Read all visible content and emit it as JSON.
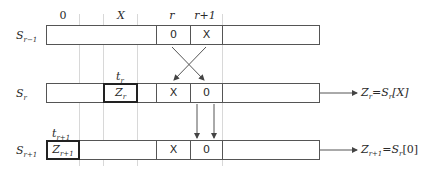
{
  "column_labels": {
    "zero": "0",
    "x": "X",
    "r": "r",
    "r_plus_1": "r+1"
  },
  "rows": [
    {
      "label": "S",
      "sub": "r−1",
      "cells": {
        "r": "0",
        "r_plus_1": "X"
      }
    },
    {
      "label": "S",
      "sub": "r",
      "highlight": {
        "label": "Z",
        "sub": "r",
        "above": "t",
        "above_sub": "r"
      },
      "cells": {
        "r": "X",
        "r_plus_1": "0"
      }
    },
    {
      "label": "S",
      "sub": "r+1",
      "highlight": {
        "label": "Z",
        "sub": "r+1",
        "above": "t",
        "above_sub": "r+1"
      },
      "cells": {
        "r": "X",
        "r_plus_1": "0"
      }
    }
  ],
  "outputs": [
    {
      "lhs": "Z",
      "lhs_sub": "r",
      "eq": "=",
      "rhs": "S",
      "rhs_sub": "r",
      "index": "[X]"
    },
    {
      "lhs": "Z",
      "lhs_sub": "r+1",
      "eq": "=",
      "rhs": "S",
      "rhs_sub": "r",
      "index": "[0]"
    }
  ],
  "colors": {
    "line": "#555555",
    "grid": "#d8d8d8",
    "highlight_border": "#222222"
  }
}
